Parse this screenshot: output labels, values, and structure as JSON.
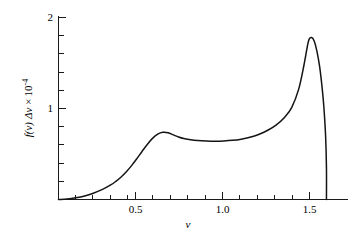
{
  "chart_data": {
    "type": "line",
    "title": "",
    "subtitle": "",
    "xlabel": "ν",
    "ylabel": "f(ν) Δν × 10⁻⁴",
    "ylabel_parts": {
      "function": "f(ν)",
      "delta": "Δν",
      "times": "×",
      "mantissa": "10",
      "exponent": "-4"
    },
    "xlim": [
      0.0,
      1.665
    ],
    "ylim": [
      0.0,
      2.08
    ],
    "grid": false,
    "legend": "none",
    "x_ticks_major": [
      0.5,
      1.0,
      1.5
    ],
    "x_tick_labels": [
      "0.5",
      "1.0",
      "1.5"
    ],
    "x_ticks_minor": [
      0.1,
      0.2,
      0.3,
      0.4,
      0.6,
      0.7,
      0.8,
      0.9,
      1.1,
      1.2,
      1.3,
      1.4,
      1.6
    ],
    "y_ticks_major": [
      1,
      2
    ],
    "y_tick_labels": [
      "1",
      "2"
    ],
    "y_ticks_minor": [
      0.2,
      0.4,
      0.6,
      0.8,
      1.2,
      1.4,
      1.6,
      1.8
    ],
    "series": [
      {
        "name": "f(ν)Δν",
        "x": [
          0.0,
          0.05,
          0.1,
          0.15,
          0.2,
          0.25,
          0.3,
          0.33,
          0.36,
          0.39,
          0.42,
          0.45,
          0.48,
          0.51,
          0.54,
          0.57,
          0.6,
          0.63,
          0.66,
          0.69,
          0.72,
          0.75,
          0.8,
          0.85,
          0.9,
          0.95,
          1.0,
          1.05,
          1.1,
          1.15,
          1.2,
          1.25,
          1.3,
          1.34,
          1.38,
          1.41,
          1.43,
          1.44,
          1.455,
          1.47,
          1.485,
          1.5,
          1.515,
          1.525,
          1.535,
          1.54,
          1.54
        ],
        "y": [
          0.0,
          0.005,
          0.018,
          0.038,
          0.068,
          0.108,
          0.16,
          0.2,
          0.248,
          0.305,
          0.372,
          0.448,
          0.528,
          0.605,
          0.672,
          0.718,
          0.738,
          0.733,
          0.71,
          0.687,
          0.67,
          0.66,
          0.648,
          0.642,
          0.64,
          0.643,
          0.65,
          0.663,
          0.684,
          0.715,
          0.758,
          0.818,
          0.905,
          1.01,
          1.21,
          1.47,
          1.68,
          1.76,
          1.78,
          1.74,
          1.63,
          1.47,
          1.23,
          1.02,
          0.7,
          0.35,
          0.0
        ],
        "peaks": [
          {
            "label": "shoulder-peak",
            "x": 0.6,
            "y": 0.74
          },
          {
            "label": "plateau-minimum",
            "x": 0.9,
            "y": 0.64
          },
          {
            "label": "main-peak",
            "x": 1.44,
            "y": 1.78
          }
        ],
        "cutoff_x": 1.54
      }
    ]
  },
  "axes": {
    "y_axis_name": "vertical-axis",
    "x_axis_name": "horizontal-axis"
  }
}
